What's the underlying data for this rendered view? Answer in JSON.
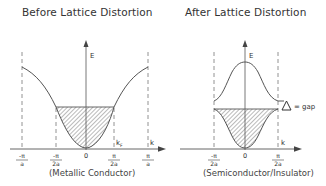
{
  "left_panel": {
    "title": "Before Lattice Distortion",
    "caption": "(Metallic Conductor)",
    "axis_y_label": "E",
    "axis_x_label": "k",
    "fermi_label": "k",
    "fermi_sub": "F",
    "tick_labels": [
      {
        "num": "-π",
        "den": "a"
      },
      {
        "num": "-π",
        "den": "2a"
      },
      {
        "single": "0"
      },
      {
        "num": "π",
        "den": "2a"
      },
      {
        "num": "π",
        "den": "a"
      }
    ]
  },
  "right_panel": {
    "title": "After Lattice Distortion",
    "caption": "(Semiconductor/Insulator)",
    "axis_y_label": "E",
    "axis_x_label": "k",
    "gap_label": "= gap",
    "gap_symbol": "Δ",
    "tick_labels": [
      {
        "num": "-π",
        "den": "2a"
      },
      {
        "single": "0"
      },
      {
        "num": "π",
        "den": "2a"
      }
    ]
  },
  "colors": {
    "line": "#555555",
    "hatch": "#666666",
    "text": "#333333"
  }
}
